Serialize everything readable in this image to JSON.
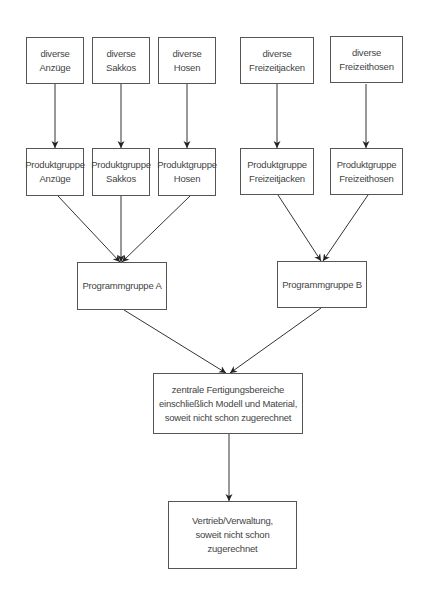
{
  "diagram": {
    "type": "hierarchy-flow",
    "colors": {
      "line": "#333333",
      "border": "#555555",
      "text": "#444444",
      "background": "#ffffff"
    },
    "row1": [
      {
        "id": "div-anzuege",
        "label": "diverse\nAnzüge"
      },
      {
        "id": "div-sakkos",
        "label": "diverse\nSakkos"
      },
      {
        "id": "div-hosen",
        "label": "diverse\nHosen"
      },
      {
        "id": "div-freizeitjacken",
        "label": "diverse\nFreizeitjacken"
      },
      {
        "id": "div-freizeithosen",
        "label": "diverse\nFreizeithosen"
      }
    ],
    "row2": [
      {
        "id": "pg-anzuege",
        "label": "Produktgruppe\nAnzüge"
      },
      {
        "id": "pg-sakkos",
        "label": "Produktgruppe\nSakkos"
      },
      {
        "id": "pg-hosen",
        "label": "Produktgruppe\nHosen"
      },
      {
        "id": "pg-freizeitjacken",
        "label": "Produktgruppe\nFreizeitjacken"
      },
      {
        "id": "pg-freizeithosen",
        "label": "Produktgruppe\nFreizeithosen"
      }
    ],
    "row3": [
      {
        "id": "prog-a",
        "label": "Programmgruppe A"
      },
      {
        "id": "prog-b",
        "label": "Programmgruppe B"
      }
    ],
    "row4": {
      "id": "zentral",
      "label": "zentrale Fertigungsbereiche\neinschließlich Modell und Material,\nsoweit nicht schon zugerechnet"
    },
    "row5": {
      "id": "vertrieb",
      "label": "Vertrieb/Verwaltung,\nsoweit nicht schon\nzugerechnet"
    },
    "edges": [
      [
        "div-anzuege",
        "pg-anzuege"
      ],
      [
        "div-sakkos",
        "pg-sakkos"
      ],
      [
        "div-hosen",
        "pg-hosen"
      ],
      [
        "div-freizeitjacken",
        "pg-freizeitjacken"
      ],
      [
        "div-freizeithosen",
        "pg-freizeithosen"
      ],
      [
        "pg-anzuege",
        "prog-a"
      ],
      [
        "pg-sakkos",
        "prog-a"
      ],
      [
        "pg-hosen",
        "prog-a"
      ],
      [
        "pg-freizeitjacken",
        "prog-b"
      ],
      [
        "pg-freizeithosen",
        "prog-b"
      ],
      [
        "prog-a",
        "zentral"
      ],
      [
        "prog-b",
        "zentral"
      ],
      [
        "zentral",
        "vertrieb"
      ]
    ]
  }
}
